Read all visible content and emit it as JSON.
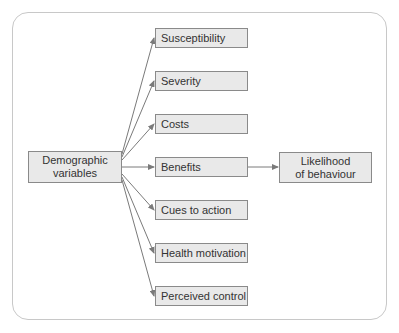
{
  "diagram": {
    "type": "flow",
    "source": {
      "label_line1": "Demographic",
      "label_line2": "variables"
    },
    "factors": [
      {
        "label": "Susceptibility"
      },
      {
        "label": "Severity"
      },
      {
        "label": "Costs"
      },
      {
        "label": "Benefits"
      },
      {
        "label": "Cues to action"
      },
      {
        "label": "Health motivation"
      },
      {
        "label": "Perceived control"
      }
    ],
    "outcome": {
      "label_line1": "Likelihood",
      "label_line2": "of behaviour"
    },
    "edges": [
      {
        "from": "Demographic variables",
        "to": "Susceptibility"
      },
      {
        "from": "Demographic variables",
        "to": "Severity"
      },
      {
        "from": "Demographic variables",
        "to": "Costs"
      },
      {
        "from": "Demographic variables",
        "to": "Benefits"
      },
      {
        "from": "Demographic variables",
        "to": "Cues to action"
      },
      {
        "from": "Demographic variables",
        "to": "Health motivation"
      },
      {
        "from": "Demographic variables",
        "to": "Perceived control"
      },
      {
        "from": "Benefits",
        "to": "Likelihood of behaviour"
      }
    ],
    "colors": {
      "box_fill": "#e9e9e9",
      "box_border": "#8a8a8a",
      "arrow": "#7a7a7a",
      "frame": "#c8c8c8",
      "text": "#333333"
    }
  }
}
